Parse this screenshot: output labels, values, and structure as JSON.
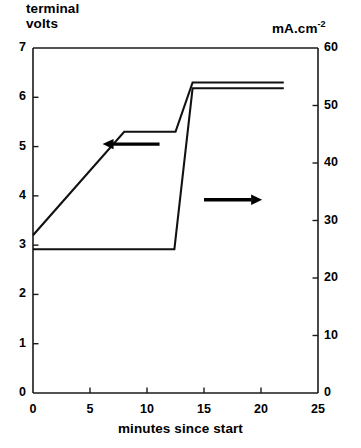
{
  "chart_data": {
    "type": "line",
    "title": "",
    "xlabel": "minutes since start",
    "ylabel_left": "terminal\nvolts",
    "ylabel_right": "mA.cm",
    "ylabel_right_exponent": "-2",
    "xlim": [
      0,
      25
    ],
    "ylim_left": [
      0,
      7
    ],
    "ylim_right": [
      0,
      60
    ],
    "xticks": [
      "0",
      "5",
      "10",
      "15",
      "20",
      "25"
    ],
    "xtick_values": [
      0,
      5,
      10,
      15,
      20,
      25
    ],
    "yticks_left": [
      "7",
      "6",
      "5",
      "4",
      "3",
      "2",
      "1",
      "0"
    ],
    "ytick_values_left": [
      7,
      6,
      5,
      4,
      3,
      2,
      1,
      0
    ],
    "yticks_right": [
      "60",
      "50",
      "40",
      "30",
      "20",
      "10",
      "0"
    ],
    "ytick_values_right": [
      60,
      50,
      40,
      30,
      20,
      10,
      0
    ],
    "grid": false,
    "legend": "none",
    "series": [
      {
        "name": "terminal volts",
        "axis": "left",
        "color": "#111111",
        "x": [
          0,
          8,
          12.5,
          14,
          22
        ],
        "values": [
          3.2,
          5.3,
          5.3,
          6.3,
          6.3
        ]
      },
      {
        "name": "current density",
        "axis": "right",
        "color": "#111111",
        "x": [
          0,
          12.4,
          14,
          22
        ],
        "values": [
          25,
          25,
          53,
          53
        ]
      }
    ],
    "annotations": [
      {
        "name": "left-arrow",
        "direction": "left",
        "x_start": 11.1,
        "x_end": 6.1,
        "y_left_axis": 5.05,
        "note": "points to left (terminal volts) axis"
      },
      {
        "name": "right-arrow",
        "direction": "right",
        "x_start": 15.0,
        "x_end": 20.1,
        "y_left_axis": 3.92,
        "note": "points to right (mA.cm^-2) axis"
      }
    ]
  },
  "figure": {
    "background": "#ffffff",
    "foreground": "#111111",
    "plot_left_px": 33,
    "plot_right_px": 318,
    "plot_top_px": 48,
    "plot_bottom_px": 393
  }
}
